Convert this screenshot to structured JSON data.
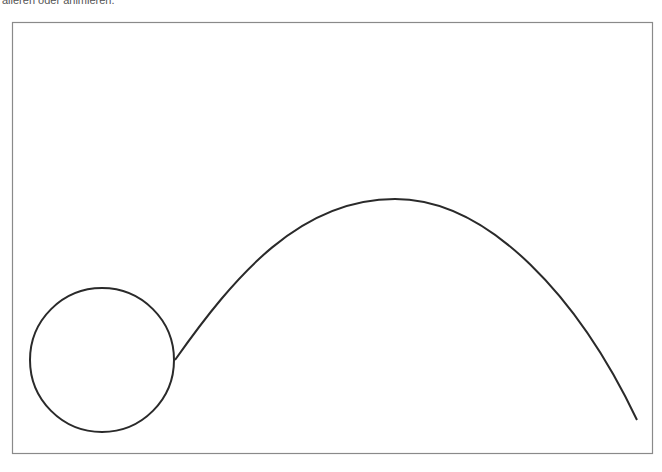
{
  "caption": "alieren oder animieren.",
  "figure": {
    "frame": {
      "x": 12,
      "y": 22,
      "width": 641,
      "height": 432,
      "stroke": "#8a8a8a"
    },
    "ball": {
      "cx": 102,
      "cy": 360,
      "r": 72,
      "stroke": "#2a2a2a"
    },
    "trajectory": {
      "start": [
        175,
        360
      ],
      "peak": [
        395,
        199
      ],
      "end": [
        637,
        420
      ],
      "stroke": "#2a2a2a"
    }
  }
}
